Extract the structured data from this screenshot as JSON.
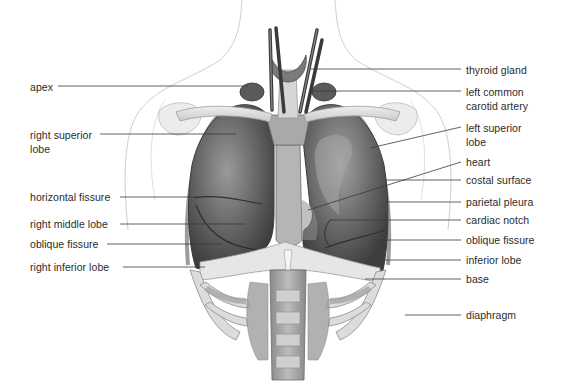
{
  "figure": {
    "illustration_style": "grayscale anatomical drawing"
  },
  "labels_left": [
    {
      "id": "apex",
      "text": [
        "apex"
      ],
      "x": 30,
      "y": 80,
      "line_y": 86,
      "line_x1": 58,
      "line_x2": 248
    },
    {
      "id": "right-superior-lobe",
      "text": [
        "right superior",
        "lobe"
      ],
      "x": 30,
      "y": 128,
      "line_y": 134,
      "line_x1": 100,
      "line_x2": 236
    },
    {
      "id": "horizontal-fissure",
      "text": [
        "horizontal fissure"
      ],
      "x": 30,
      "y": 190,
      "line_y": 197,
      "line_x1": 120,
      "line_x2": 200
    },
    {
      "id": "right-middle-lobe",
      "text": [
        "right middle lobe"
      ],
      "x": 30,
      "y": 217,
      "line_y": 224,
      "line_x1": 120,
      "line_x2": 245
    },
    {
      "id": "oblique-fissure-right",
      "text": [
        "oblique fissure"
      ],
      "x": 30,
      "y": 237,
      "line_y": 244,
      "line_x1": 107,
      "line_x2": 222
    },
    {
      "id": "right-inferior-lobe",
      "text": [
        "right inferior lobe"
      ],
      "x": 30,
      "y": 260,
      "line_y": 267,
      "line_x1": 123,
      "line_x2": 205
    }
  ],
  "labels_right": [
    {
      "id": "thyroid-gland",
      "text": [
        "thyroid gland"
      ],
      "x": 466,
      "y": 63,
      "line_y": 69,
      "line_x1": 310,
      "line_x2": 461
    },
    {
      "id": "left-common-carotid-artery",
      "text": [
        "left common",
        "carotid artery"
      ],
      "x": 466,
      "y": 85,
      "line_y": 91,
      "line_x1": 312,
      "line_x2": 461
    },
    {
      "id": "left-superior-lobe",
      "text": [
        "left superior",
        "lobe"
      ],
      "x": 466,
      "y": 121,
      "line_y": 127,
      "line_x1": 370,
      "line_y1": 148,
      "line_x2": 461
    },
    {
      "id": "heart",
      "text": [
        "heart"
      ],
      "x": 466,
      "y": 155,
      "line_y": 162,
      "line_x1": 308,
      "line_y1": 210,
      "line_x2": 461
    },
    {
      "id": "costal-surface",
      "text": [
        "costal surface"
      ],
      "x": 466,
      "y": 173,
      "line_y": 180,
      "line_x1": 385,
      "line_x2": 461
    },
    {
      "id": "parietal-pleura",
      "text": [
        "parietal pleura"
      ],
      "x": 466,
      "y": 195,
      "line_y": 202,
      "line_x1": 385,
      "line_x2": 461
    },
    {
      "id": "cardiac-notch",
      "text": [
        "cardiac notch"
      ],
      "x": 466,
      "y": 213,
      "line_y": 220,
      "line_x1": 330,
      "line_x2": 461
    },
    {
      "id": "oblique-fissure-left",
      "text": [
        "oblique fissure"
      ],
      "x": 466,
      "y": 233,
      "line_y": 240,
      "line_x1": 370,
      "line_x2": 461
    },
    {
      "id": "inferior-lobe",
      "text": [
        "inferior lobe"
      ],
      "x": 466,
      "y": 253,
      "line_y": 260,
      "line_x1": 375,
      "line_x2": 461
    },
    {
      "id": "base",
      "text": [
        "base"
      ],
      "x": 466,
      "y": 272,
      "line_y": 279,
      "line_x1": 365,
      "line_x2": 461
    },
    {
      "id": "diaphragm",
      "text": [
        "diaphragm"
      ],
      "x": 466,
      "y": 308,
      "line_y": 315,
      "line_x1": 405,
      "line_x2": 461
    }
  ],
  "colors": {
    "background": "#ffffff",
    "label_text": "#2b2b2b",
    "leader_line": "#3a3a3a",
    "lung_dark": "#4a4a4a",
    "lung_mid": "#6e6e6e",
    "lung_light": "#9a9a9a",
    "bone": "#d9d9d9",
    "outline": "#bdbdbd"
  }
}
